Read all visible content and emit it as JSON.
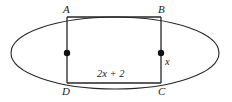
{
  "figure": {
    "type": "geometry-diagram",
    "background_color": "#ffffff",
    "stroke_color": "#262626",
    "text_color": "#1a1a1a",
    "labels": {
      "vertex_a": "A",
      "vertex_b": "B",
      "vertex_c": "C",
      "vertex_d": "D",
      "base_measure": "2x + 2",
      "height_measure": "x"
    },
    "geometry": {
      "ellipse": {
        "center_x": 115,
        "center_y": 53,
        "radius_x": 104,
        "radius_y": 36
      },
      "rectangle": {
        "left_x": 67,
        "right_x": 161,
        "top_y": 17,
        "bottom_y": 83
      },
      "midpoint_dots": [
        {
          "x": 67,
          "y": 53,
          "radius": 3.2
        },
        {
          "x": 161,
          "y": 53,
          "radius": 3.2
        }
      ]
    }
  }
}
